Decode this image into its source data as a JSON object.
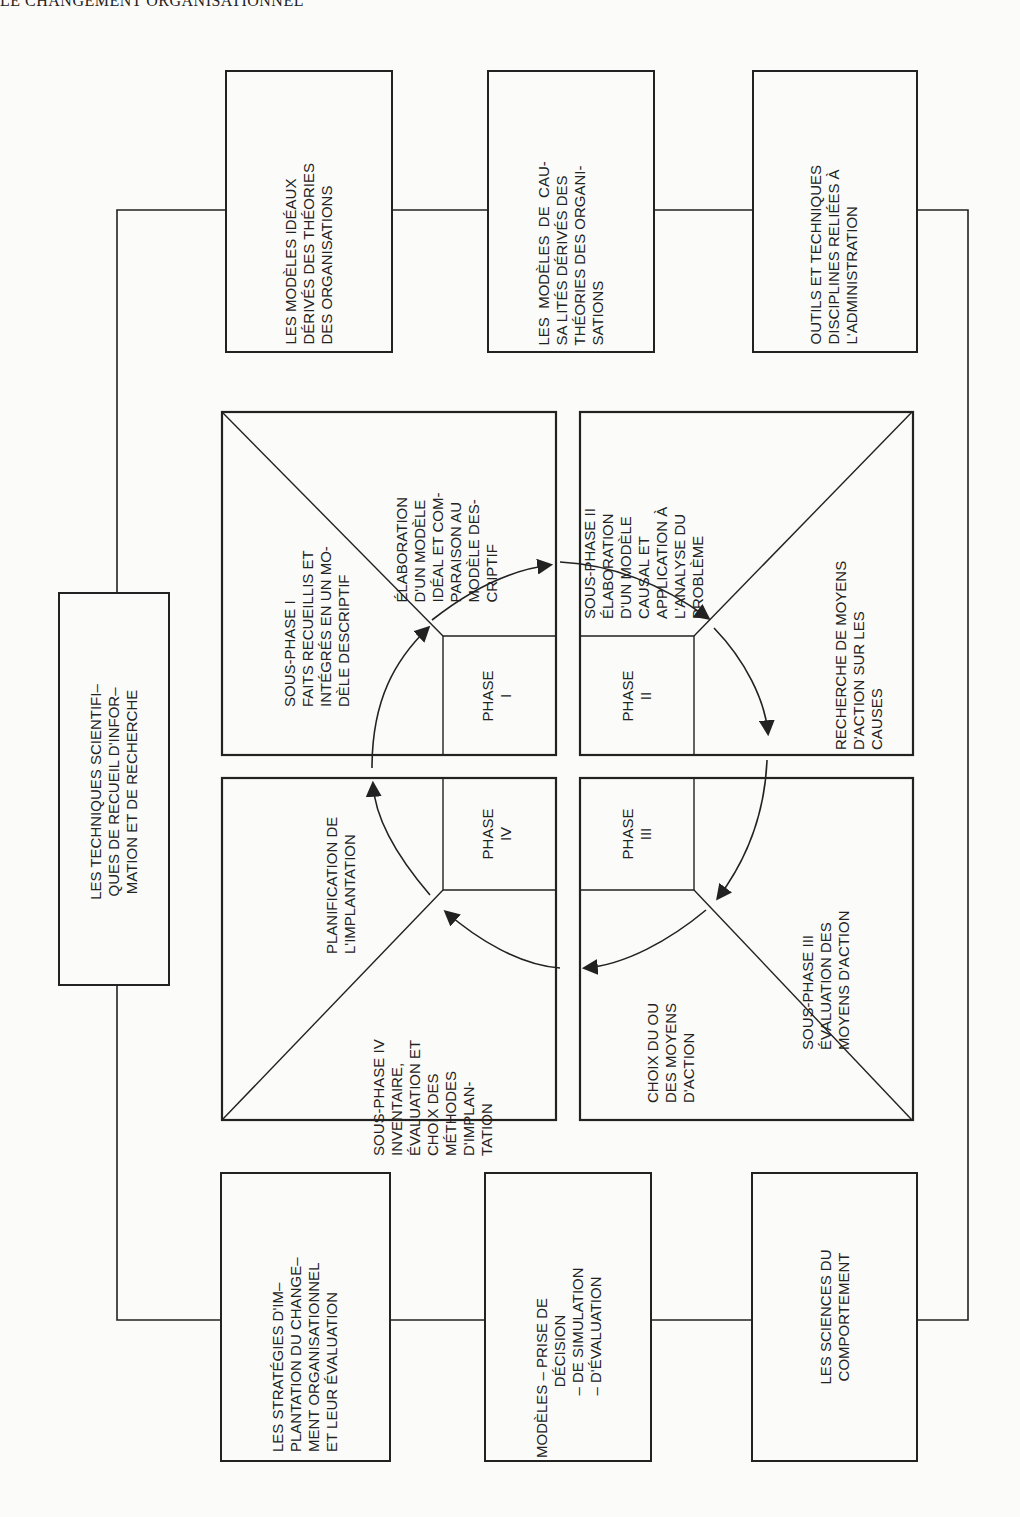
{
  "header": {
    "running_title": "LE CHANGEMENT ORGANISATIONNEL"
  },
  "left_box": {
    "text": "LES TECHNIQUES SCIENTIFI–\nQUES DE RECUEIL D'INFOR–\nMATION ET DE RECHERCHE"
  },
  "top_boxes": [
    {
      "text": "LES MODÈLES IDÉAUX\nDÉRIVÉS DES THÉORIES\nDES ORGANISATIONS"
    },
    {
      "text": "LES  MODÈLES  DE  CAU-\nSA LITÉS DÉRIVÉS DES\nTHÉORIES DES ORGANI-\nSATIONS"
    },
    {
      "text": "OUTILS ET TECHNIQUES\nDISCIPLINES RELIÉES À\nL'ADMINISTRATION"
    }
  ],
  "bottom_boxes": [
    {
      "text": "LES STRATÉGIES D'IM–\nPLANTATION DU CHANGE–\nMENT ORGANISATIONNEL\nET LEUR ÉVALUATION"
    },
    {
      "text": "MODÈLES – PRISE DE\n                 DÉCISION\n               – DE SIMULATION\n               – D'ÉVALUATION"
    },
    {
      "text": "LES SCIENCES DU\nCOMPORTEMENT"
    }
  ],
  "quadrants": {
    "phase1": {
      "phase_label": "PHASE\nI",
      "subphase": "SOUS-PHASE I\nFAITS RECUEILLIS ET\nINTÉGRÉS EN UN MO-\nDÈLE DESCRIPTIF",
      "step": "ÉLABORATION\nD'UN MODÈLE\nIDÉAL ET COM-\nPARAISON AU\nMODÈLE DES-\nCRIPTIF"
    },
    "phase2": {
      "phase_label": "PHASE\nII",
      "subphase": "SOUS-PHASE II\nÉLABORATION\nD'UN MODÈLE\nCAUSAL ET\nAPPLICATION À\nL'ANALYSE DU\nPROBLÈME",
      "step": "RECHERCHE DE MOYENS\nD'ACTION SUR LES\nCAUSES"
    },
    "phase3": {
      "phase_label": "PHASE\nIII",
      "subphase": "SOUS-PHASE III\nÉVALUATION DES\nMOYENS D'ACTION",
      "step": "CHOIX DU OU\nDES MOYENS\nD'ACTION"
    },
    "phase4": {
      "phase_label": "PHASE\nIV",
      "subphase": "SOUS-PHASE IV\nINVENTAIRE,\nÉVALUATION ET\nCHOIX DES\nMÉTHODES\nD'IMPLAN-\nTATION",
      "step": "PLANIFICATION DE\nL'IMPLANTATION"
    }
  },
  "colors": {
    "ink": "#222222",
    "paper": "#fbfbf9"
  }
}
